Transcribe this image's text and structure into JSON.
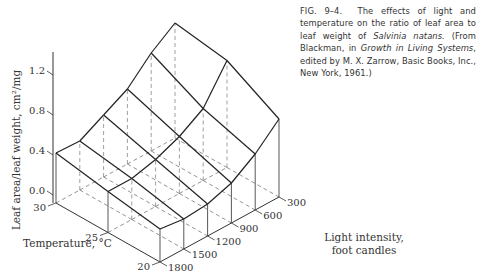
{
  "caption": {
    "fig": "FIG. 9–4.",
    "text1": "The effects of light and temperature on the ratio of leaf area to leaf weight of ",
    "species": "Salvinia natans.",
    "text2": " (From Blackman, in ",
    "book": "Growth in Living Systems",
    "text3": ", edited by M. X. Zarrow, Basic Books, Inc., New York, 1961.)"
  },
  "chart_data": {
    "type": "surface3d",
    "title": "The effects of light and temperature on the ratio of leaf area to leaf weight of Salvinia natans",
    "zlabel": "Leaf area/leaf weight, cm²/mg",
    "xlabel": "Temperature, °C",
    "ylabel": "Light intensity, foot candles",
    "z_ticks": [
      "0.0",
      "0.4",
      "0.8",
      "1.2"
    ],
    "zlim": [
      0,
      1.4
    ],
    "temperature": [
      30,
      25,
      20
    ],
    "light": [
      1800,
      1500,
      1200,
      900,
      600,
      300
    ],
    "values": [
      [
        0.5,
        0.49,
        0.62,
        0.75,
        0.98,
        1.15
      ],
      [
        0.41,
        0.41,
        0.47,
        0.57,
        0.72,
        1.07
      ],
      [
        0.33,
        0.3,
        0.32,
        0.4,
        0.56,
        0.78
      ]
    ],
    "grid": true,
    "legend": null
  },
  "projection": {
    "origin": [
      56,
      203
    ],
    "temp_step": [
      52,
      29.5
    ],
    "light_step": [
      23.8,
      -13
    ],
    "z_scale": 100,
    "axis_top": 52
  }
}
